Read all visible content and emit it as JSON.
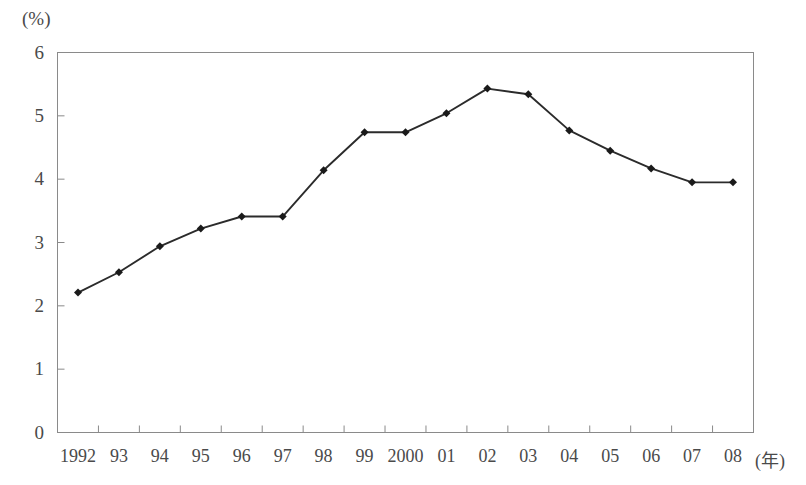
{
  "chart_data": {
    "type": "line",
    "title": "",
    "subtitle": "",
    "xlabel": "(年)",
    "ylabel": "(%)",
    "categories": [
      "1992",
      "93",
      "94",
      "95",
      "96",
      "97",
      "98",
      "99",
      "2000",
      "01",
      "02",
      "03",
      "04",
      "05",
      "06",
      "07",
      "08"
    ],
    "values": [
      2.21,
      2.53,
      2.94,
      3.22,
      3.41,
      3.41,
      4.14,
      4.74,
      4.74,
      5.04,
      5.43,
      5.34,
      4.77,
      4.45,
      4.17,
      3.95,
      3.95
    ],
    "series": [
      {
        "name": "",
        "values": [
          2.21,
          2.53,
          2.94,
          3.22,
          3.41,
          3.41,
          4.14,
          4.74,
          4.74,
          5.04,
          5.43,
          5.34,
          4.77,
          4.45,
          4.17,
          3.95,
          3.95
        ]
      }
    ],
    "ylim": [
      0,
      6
    ],
    "yticks": [
      0,
      1,
      2,
      3,
      4,
      5,
      6
    ],
    "ytick_labels": [
      "0",
      "1",
      "2",
      "3",
      "4",
      "5",
      "6"
    ],
    "grid": false,
    "legend": false,
    "legend_position": "none",
    "marker": "diamond",
    "line_color": "#2b2b2b",
    "marker_color": "#1a1a1a",
    "axis_color": "#8a8a8a"
  },
  "axes": {
    "y_unit": "(%)",
    "x_unit": "(年)"
  }
}
